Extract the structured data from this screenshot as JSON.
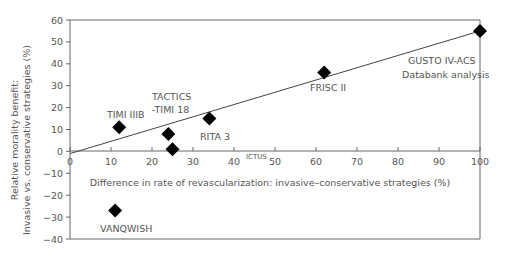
{
  "chart_data": {
    "type": "scatter",
    "title": "",
    "xlabel": "Difference in rate of revascularization: invasive–conservative strategies (%)",
    "ylabel_line1": "Relative morality benefit:",
    "ylabel_line2": "Invasive vs. conservative strategies (%)",
    "xlim": [
      0,
      100
    ],
    "ylim": [
      -40,
      60
    ],
    "x_ticks": [
      0,
      10,
      20,
      30,
      40,
      50,
      60,
      70,
      80,
      90,
      100
    ],
    "y_ticks": [
      60,
      50,
      40,
      30,
      20,
      10,
      0,
      -10,
      -20,
      -30,
      -40
    ],
    "grid": false,
    "legend": null,
    "marker": "diamond",
    "points": [
      {
        "label": "TIMI IIIB",
        "x": 12,
        "y": 11
      },
      {
        "label": "TACTICS -TIMI 18",
        "x": 24,
        "y": 8
      },
      {
        "label": "ICTUS",
        "x": 25,
        "y": 1
      },
      {
        "label": "RITA 3",
        "x": 34,
        "y": 15
      },
      {
        "label": "FRISC II",
        "x": 62,
        "y": 36
      },
      {
        "label": "GUSTO IV-ACS Databank analysis",
        "x": 100,
        "y": 55
      },
      {
        "label": "VANQWISH",
        "x": 11,
        "y": -27
      }
    ],
    "trendline": {
      "x0": 0,
      "y0": -1,
      "x1": 100,
      "y1": 55
    }
  },
  "labels": {
    "timi": "TIMI IIIB",
    "tactics1": "TACTICS",
    "tactics2": "-TIMI 18",
    "ictus": "ICTUS",
    "rita": "RITA 3",
    "frisc": "FRISC II",
    "gusto1": "GUSTO IV-ACS",
    "gusto2": "Databank analysis",
    "vanq": "VANQWISH"
  }
}
